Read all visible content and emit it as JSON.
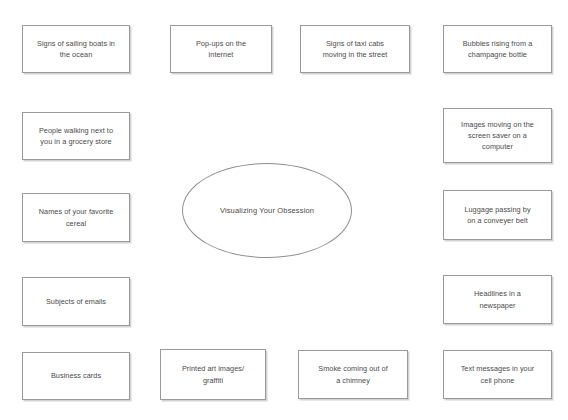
{
  "diagram": {
    "title": "Visualizing Your Obsession",
    "type": "mind-map",
    "center": {
      "label": "Visualizing Your Obsession",
      "shape": "ellipse",
      "x": 182,
      "y": 163,
      "width": 170,
      "height": 95
    },
    "style": {
      "background": "#ffffff",
      "node_fill": "#ffffff",
      "node_border": "#9a9a9a",
      "text_color": "#4b4b4b",
      "shadow_color": "#8c8c8c"
    },
    "nodes": [
      {
        "id": "node-sailing-boats",
        "label": "Signs of sailing boats in\nthe ocean",
        "x": 22,
        "y": 25,
        "width": 108,
        "height": 48,
        "column": 1,
        "row": 1
      },
      {
        "id": "node-pop-ups",
        "label": "Pop-ups on the\ninternet",
        "x": 170,
        "y": 25,
        "width": 102,
        "height": 48,
        "column": 2,
        "row": 1
      },
      {
        "id": "node-taxi-cabs",
        "label": "Signs of taxi cabs\nmoving in the street",
        "x": 300,
        "y": 25,
        "width": 110,
        "height": 48,
        "column": 3,
        "row": 1
      },
      {
        "id": "node-bubbles-champagne",
        "label": "Bubbles rising from a\nchampagne bottle",
        "x": 443,
        "y": 25,
        "width": 109,
        "height": 48,
        "column": 4,
        "row": 1
      },
      {
        "id": "node-people-walking",
        "label": "People walking next to\nyou in a grocery store",
        "x": 22,
        "y": 112,
        "width": 108,
        "height": 48,
        "column": 1,
        "row": 2
      },
      {
        "id": "node-screen-saver",
        "label": "Images moving on the\nscreen saver on a\ncomputer",
        "x": 443,
        "y": 108,
        "width": 109,
        "height": 55,
        "column": 4,
        "row": 2
      },
      {
        "id": "node-favorite-cereal",
        "label": "Names of your favorite\ncereal",
        "x": 22,
        "y": 193,
        "width": 108,
        "height": 49,
        "column": 1,
        "row": 3
      },
      {
        "id": "node-luggage-conveyer",
        "label": "Luggage passing by\non a conveyer belt",
        "x": 443,
        "y": 190,
        "width": 109,
        "height": 50,
        "column": 4,
        "row": 3
      },
      {
        "id": "node-email-subjects",
        "label": "Subjects of emails",
        "x": 22,
        "y": 277,
        "width": 108,
        "height": 49,
        "column": 1,
        "row": 4
      },
      {
        "id": "node-headlines-newspaper",
        "label": "Headlines in a\nnewspaper",
        "x": 443,
        "y": 275,
        "width": 109,
        "height": 49,
        "column": 4,
        "row": 4
      },
      {
        "id": "node-business-cards",
        "label": "Business cards",
        "x": 22,
        "y": 352,
        "width": 108,
        "height": 48,
        "column": 1,
        "row": 5
      },
      {
        "id": "node-printed-art",
        "label": "Printed art images/\ngraffiti",
        "x": 160,
        "y": 349,
        "width": 106,
        "height": 51,
        "column": 2,
        "row": 5
      },
      {
        "id": "node-smoke-chimney",
        "label": "Smoke coming out of\na chimney",
        "x": 298,
        "y": 350,
        "width": 110,
        "height": 49,
        "column": 3,
        "row": 5
      },
      {
        "id": "node-text-messages",
        "label": "Text messages in your\ncell phone",
        "x": 443,
        "y": 350,
        "width": 109,
        "height": 49,
        "column": 4,
        "row": 5
      }
    ]
  }
}
